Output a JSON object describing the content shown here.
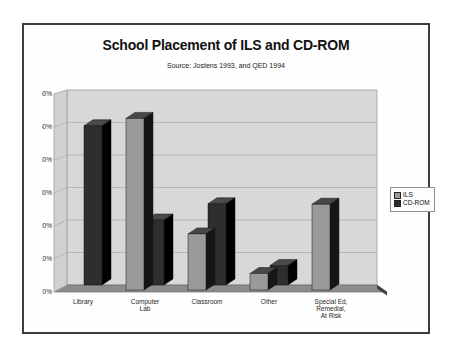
{
  "title": "School Placement of ILS and CD-ROM",
  "subtitle": "Source: Jostens 1993, and QED 1994",
  "legend": {
    "position": "right",
    "items": [
      {
        "label": "ILS"
      },
      {
        "label": "CD-ROM"
      }
    ]
  },
  "y_axis": {
    "tick_labels": [
      "0%",
      "10%",
      "20%",
      "30%",
      "40%",
      "50%",
      "60%"
    ]
  },
  "chart_data": {
    "type": "bar",
    "variant": "3d-clustered-perspective",
    "title": "School Placement of ILS and CD-ROM",
    "subtitle": "Source: Jostens 1993, and QED 1994",
    "categories": [
      "Library",
      "Computer Lab",
      "Classroom",
      "Other",
      "Special Ed, Remedial, At Risk"
    ],
    "category_label_lines": [
      [
        "Library"
      ],
      [
        "Computer",
        "Lab"
      ],
      [
        "Classroom"
      ],
      [
        "Other"
      ],
      [
        "Special Ed,",
        "Remedial,",
        "At Risk"
      ]
    ],
    "series": [
      {
        "name": "ILS",
        "values": [
          0,
          52,
          17,
          5,
          26
        ],
        "front": "#9a9a9a",
        "top": "#474747",
        "side": "#161616"
      },
      {
        "name": "CD-ROM",
        "values": [
          49,
          20,
          25,
          6,
          0
        ],
        "front": "#2e2e2e",
        "top": "#4a4a4a",
        "side": "#000000"
      }
    ],
    "xlabel": "",
    "ylabel": "",
    "ylim": [
      0,
      60
    ],
    "ytick_step": 10,
    "ytick_labels": [
      "0%",
      "10%",
      "20%",
      "30%",
      "40%",
      "50%",
      "60%"
    ],
    "grid": true,
    "legend_position": "right"
  },
  "colors": {
    "frame_border": "#3c3c3c",
    "wall": "#d8d8d8",
    "side_wall": "#d1d1d1",
    "wall_stroke": "#9e9e9e",
    "gridline": "#ababab",
    "floor": "#8c8c8c",
    "floor_stroke": "#5f5f5f",
    "floor_edge": "#3f3f3f",
    "bar_outline": "#141414",
    "text": "#1f1f1f"
  }
}
